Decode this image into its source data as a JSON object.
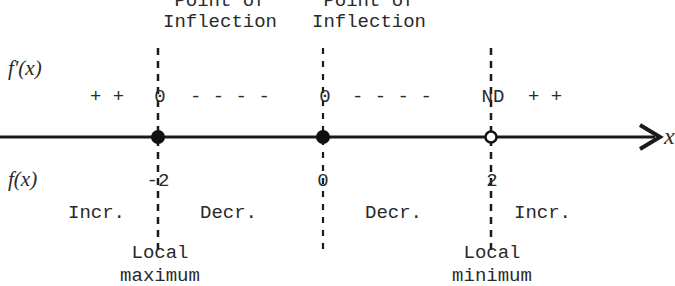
{
  "diagram": {
    "type": "sign-chart",
    "axis": {
      "label": "x",
      "color": "#1a1a1a"
    },
    "row_labels": {
      "derivative": "f'(x)",
      "function": "f(x)"
    },
    "critical_points": [
      {
        "x_value": "-2",
        "derivative_value": "0",
        "marker": "filled",
        "top_label_line1": "Point of",
        "top_label_line2": "Inflection",
        "bottom_label_line1": "Local",
        "bottom_label_line2": "maximum"
      },
      {
        "x_value": "0",
        "derivative_value": "0",
        "marker": "filled",
        "top_label_line1": "Point of",
        "top_label_line2": "Inflection"
      },
      {
        "x_value": "2",
        "derivative_value": "ND",
        "marker": "open",
        "bottom_label_line1": "Local",
        "bottom_label_line2": "minimum"
      }
    ],
    "derivative_signs": {
      "interval1": "+ +",
      "interval2": "- - - -",
      "interval3": "- - - -",
      "interval4": "+ +"
    },
    "behavior": {
      "interval1": "Incr.",
      "interval2": "Decr.",
      "interval3": "Decr.",
      "interval4": "Incr."
    }
  }
}
